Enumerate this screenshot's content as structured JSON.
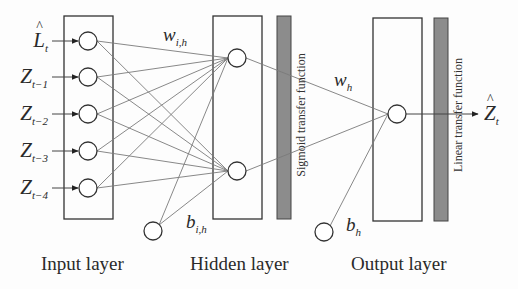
{
  "diagram": {
    "type": "neural-network-architecture",
    "colors": {
      "line": "#333333",
      "connection": "#6e6e6e",
      "transfer_bar": "#8c8c8c",
      "background": "#fdfdfd"
    },
    "input_layer": {
      "title": "Input layer",
      "inputs": [
        {
          "base": "L",
          "hat": true,
          "sub": "t"
        },
        {
          "base": "Z",
          "hat": false,
          "sub": "t−1"
        },
        {
          "base": "Z",
          "hat": false,
          "sub": "t−2"
        },
        {
          "base": "Z",
          "hat": false,
          "sub": "t−3"
        },
        {
          "base": "Z",
          "hat": false,
          "sub": "t−4"
        }
      ],
      "node_count": 5
    },
    "hidden_layer": {
      "title": "Hidden layer",
      "node_count": 2,
      "transfer_function": "Sigmoid transfer function",
      "weight_label": {
        "base": "w",
        "sub": "i,h"
      },
      "bias_label": {
        "base": "b",
        "sub": "i,h"
      }
    },
    "output_layer": {
      "title": "Output layer",
      "node_count": 1,
      "transfer_function": "Linear transfer function",
      "weight_label": {
        "base": "w",
        "sub": "h"
      },
      "bias_label": {
        "base": "b",
        "sub": "h"
      },
      "output": {
        "base": "Z",
        "hat": true,
        "sub": "t"
      }
    }
  }
}
